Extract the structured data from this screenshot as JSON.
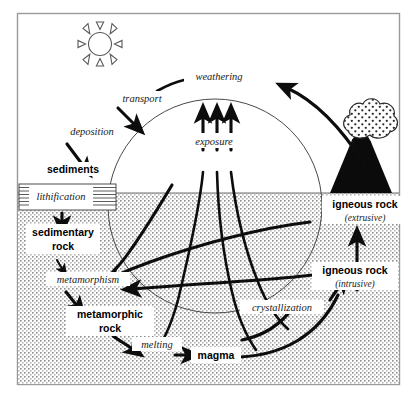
{
  "diagram": {
    "frame_color": "#9a9a9a",
    "ground_color": "#6d6d6d",
    "arrow_color": "#0d0d0d",
    "circle_color": "#4a4a4a",
    "subsurface_fill": "#e8e8e8"
  },
  "labels": {
    "weathering": "weathering",
    "transport": "transport",
    "deposition": "deposition",
    "sediments": "sediments",
    "lithification": "lithification",
    "sedimentary_rock_line1": "sedimentary",
    "sedimentary_rock_line2": "rock",
    "metamorphism": "metamorphism",
    "metamorphic_rock_line1": "metamorphic",
    "metamorphic_rock_line2": "rock",
    "melting": "melting",
    "magma": "magma",
    "crystallization": "crystallization",
    "igneous_intrusive_main": "igneous rock",
    "igneous_intrusive_sub": "(intrusive)",
    "igneous_extrusive_main": "igneous rock",
    "igneous_extrusive_sub": "(extrusive)",
    "exposure": "exposure"
  },
  "icons": {
    "sun": "sun-icon",
    "volcano": "volcano-icon",
    "ash_cloud": "ash-cloud-icon"
  },
  "processes": [
    "weathering",
    "transport",
    "deposition",
    "lithification",
    "metamorphism",
    "melting",
    "crystallization",
    "exposure"
  ],
  "rock_types": [
    "sediments",
    "sedimentary rock",
    "metamorphic rock",
    "magma",
    "igneous rock (intrusive)",
    "igneous rock (extrusive)"
  ]
}
